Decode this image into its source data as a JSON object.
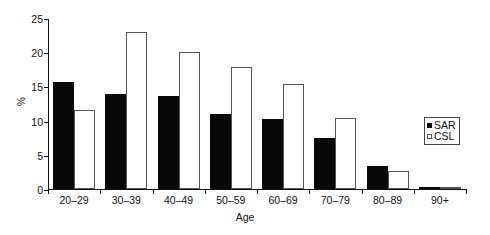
{
  "chart_data": {
    "type": "bar",
    "title": "",
    "xlabel": "Age",
    "ylabel": "%",
    "categories": [
      "20–29",
      "30–39",
      "40–49",
      "50–59",
      "60–69",
      "70–79",
      "80–89",
      "90+"
    ],
    "series": [
      {
        "name": "SAR",
        "color": "#080808",
        "fill": "solid",
        "values": [
          15.7,
          13.9,
          13.6,
          11.0,
          10.3,
          7.4,
          3.3,
          0.3
        ]
      },
      {
        "name": "CSL",
        "color": "#ffffff",
        "fill": "open",
        "values": [
          11.5,
          22.9,
          20.0,
          17.9,
          15.4,
          10.4,
          2.6,
          0.2
        ]
      }
    ],
    "ylim": [
      0,
      25
    ],
    "yticks": [
      0,
      5,
      10,
      15,
      20,
      25
    ],
    "ytick_labels": [
      "0",
      "5",
      "10",
      "15",
      "20",
      "25"
    ],
    "grid": false,
    "legend_position": "right-inside",
    "legend_entries": [
      "SAR",
      "CSL"
    ]
  },
  "axes": {
    "y_label": "%",
    "x_label": "Age",
    "y_tick_labels": [
      "25",
      "20",
      "15",
      "10",
      "5",
      "0"
    ],
    "x_tick_labels": [
      "20–29",
      "30–39",
      "40–49",
      "50–59",
      "60–69",
      "70–79",
      "80–89",
      "90+"
    ]
  },
  "legend": {
    "items": [
      {
        "label": "SAR",
        "marker": "filled-square"
      },
      {
        "label": "CSL",
        "marker": "open-square"
      }
    ]
  }
}
